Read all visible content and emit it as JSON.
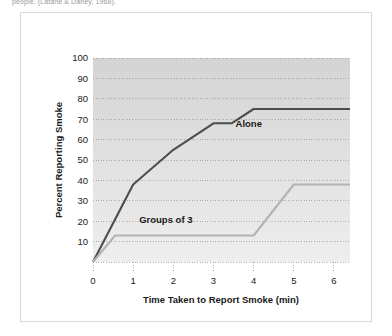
{
  "caption": "people. (Latané & Darley, 1968).",
  "figure": {
    "frame_color": "#d9d9d9",
    "plot_bg_top": "#d6d6d6",
    "plot_bg_bottom": "#ececec"
  },
  "chart_data": {
    "type": "line",
    "title": "",
    "xlabel": "Time Taken to Report Smoke (min)",
    "ylabel": "Percent Reporting Smoke",
    "xlim": [
      0,
      6.4
    ],
    "ylim": [
      0,
      100
    ],
    "xticks": [
      "0",
      "1",
      "2",
      "3",
      "4",
      "5",
      "6"
    ],
    "xtick_values": [
      0,
      1,
      2,
      3,
      4,
      5,
      6
    ],
    "yticks": [
      "10",
      "20",
      "30",
      "40",
      "50",
      "60",
      "70",
      "80",
      "90",
      "100"
    ],
    "ytick_values": [
      10,
      20,
      30,
      40,
      50,
      60,
      70,
      80,
      90,
      100
    ],
    "grid": true,
    "legend": "inline-labels",
    "series": [
      {
        "name": "Alone",
        "color": "#4d4d4d",
        "label_x": 3.55,
        "label_y": 66,
        "x": [
          0,
          1,
          2,
          3,
          3.45,
          4.0,
          6.4
        ],
        "values": [
          0,
          38,
          55,
          68,
          68,
          75,
          75
        ]
      },
      {
        "name": "Groups of 3",
        "color": "#b3b3b3",
        "label_x": 1.15,
        "label_y": 19,
        "x": [
          0,
          0.55,
          4.0,
          5.0,
          6.4
        ],
        "values": [
          0,
          13,
          13,
          38,
          38
        ]
      }
    ]
  }
}
